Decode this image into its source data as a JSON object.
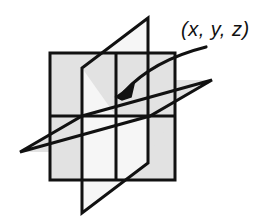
{
  "figure": {
    "kind": "3d-coordinate-planes-diagram",
    "background_color": "#ffffff",
    "stroke_color": "#111111",
    "plane_fill_color": "#e2e2e2",
    "plane_fill_color_light": "#f4f4f4",
    "stroke_width": 3,
    "width": 273,
    "height": 220,
    "annotation": {
      "label": "(x, y, z)",
      "label_x": 181,
      "label_y": 19,
      "pointer": "curved-arrow",
      "arrow_from_x": 206,
      "arrow_from_y": 47,
      "arrow_tip_x": 116,
      "arrow_tip_y": 97
    },
    "planes": [
      {
        "name": "vertical-frontal-plane",
        "orientation": "xz-plane",
        "shape": "square",
        "fill": "#e2e2e2",
        "points": "50,53 175,53 175,180 50,180"
      },
      {
        "name": "horizontal-plane",
        "orientation": "xy-plane",
        "shape": "parallelogram",
        "fill": "#e2e2e2",
        "points": "20,152 82,116 212,80 150,116"
      },
      {
        "name": "vertical-sagittal-plane",
        "orientation": "yz-plane",
        "shape": "parallelogram",
        "fill": "#f4f4f4",
        "points": "148,18 82,68 82,213 148,163"
      }
    ],
    "intersection_point": {
      "name": "origin-point",
      "x": 116,
      "y": 116
    }
  }
}
